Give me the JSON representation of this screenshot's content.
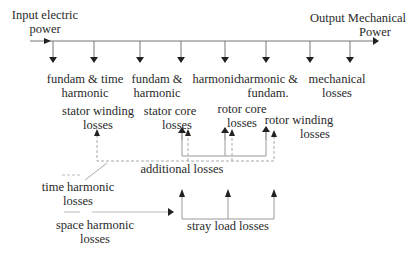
{
  "diagram": {
    "input_label": [
      "Input electric",
      "power"
    ],
    "output_label": [
      "Output Mechanical",
      "Power"
    ],
    "flow_taps": [
      {
        "label": [
          "fundam & time",
          "harmonic"
        ]
      },
      {
        "label": [
          "fundam &",
          "harmonic"
        ]
      },
      {
        "label": [
          "harmonic"
        ]
      },
      {
        "label": [
          "harmonic &",
          "fundam."
        ]
      },
      {
        "label": [
          "mechanical",
          "losses"
        ]
      }
    ],
    "loss_components": {
      "stator_winding": [
        "stator winding",
        "losses"
      ],
      "stator_core": [
        "stator core",
        "losses"
      ],
      "rotor_core": [
        "rotor core",
        "losses"
      ],
      "rotor_winding": [
        "rotor winding",
        "losses"
      ]
    },
    "groups": {
      "additional": "additional losses",
      "stray_load": "stray load losses"
    },
    "sources": {
      "time_harmonic": [
        "time harmonic",
        "losses"
      ],
      "space_harmonic": [
        "space harmonic",
        "losses"
      ]
    },
    "colors": {
      "line": "#555555",
      "dashed": "#9a9a9a",
      "text": "#2a2a2a"
    }
  }
}
